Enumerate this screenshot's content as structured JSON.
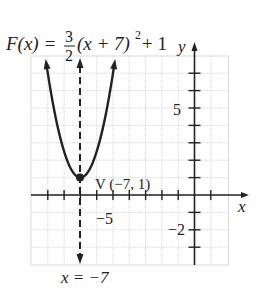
{
  "chart_data": {
    "type": "line",
    "function": {
      "name": "F(x)",
      "a": "3/2",
      "h": -7,
      "k": 1
    },
    "xlabel": "x",
    "ylabel": "y",
    "xlim": [
      -10,
      2
    ],
    "ylim": [
      -4,
      8
    ],
    "grid": true,
    "x_tick_labels": [
      {
        "value": -5,
        "label": "−5"
      }
    ],
    "y_tick_labels": [
      {
        "value": 5,
        "label": "5"
      },
      {
        "value": -2,
        "label": "−2"
      }
    ],
    "vertex": {
      "x": -7,
      "y": 1,
      "label": "V (−7, 1)"
    },
    "axis_of_symmetry": {
      "x": -7,
      "label": "x = −7",
      "style": "dashed"
    },
    "sample_points": [
      {
        "x": -9.5,
        "y": 10.375
      },
      {
        "x": -9,
        "y": 7
      },
      {
        "x": -8,
        "y": 2.5
      },
      {
        "x": -7,
        "y": 1
      },
      {
        "x": -6,
        "y": 2.5
      },
      {
        "x": -5,
        "y": 7
      },
      {
        "x": -4.5,
        "y": 10.375
      }
    ]
  },
  "labels": {
    "title_lhs": "F(x) = ",
    "frac_num": "3",
    "frac_den": "2",
    "title_rhs": "(x + 7)",
    "exp": "2",
    "title_tail": " + 1",
    "x_axis": "x",
    "y_axis": "y",
    "tick_neg5": "−5",
    "tick_5": "5",
    "tick_neg2": "−2",
    "vertex": "V (−7, 1)",
    "axis_sym": "x = −7"
  }
}
